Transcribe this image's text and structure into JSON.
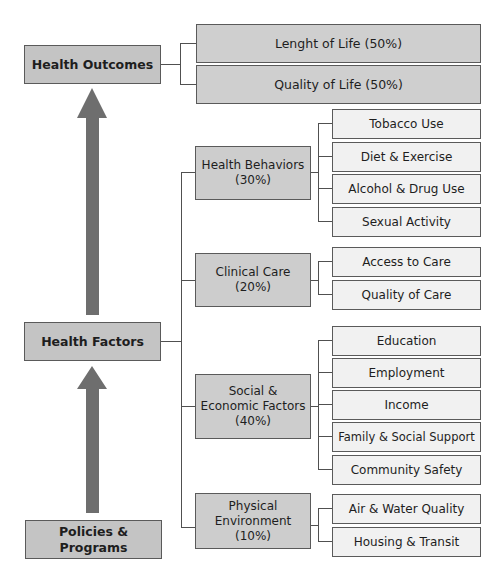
{
  "diagram": {
    "type": "health-factors-model",
    "colors": {
      "main_box": "#c4c4c4",
      "category_box": "#cdcdcd",
      "leaf_box": "#f1f1f1",
      "arrow": "#6e6e6e",
      "line": "#505050"
    },
    "main": {
      "outcomes": "Health Outcomes",
      "factors": "Health Factors",
      "policies": "Policies & Programs"
    },
    "outcomes": [
      {
        "label": "Lenght of Life (50%)"
      },
      {
        "label": "Quality of Life (50%)"
      }
    ],
    "categories": [
      {
        "line1": "Health Behaviors",
        "line2": "(30%)",
        "line3": "",
        "items": [
          "Tobacco Use",
          "Diet & Exercise",
          "Alcohol & Drug Use",
          "Sexual Activity"
        ]
      },
      {
        "line1": "Clinical Care",
        "line2": "(20%)",
        "line3": "",
        "items": [
          "Access to Care",
          "Quality of Care"
        ]
      },
      {
        "line1": "Social &",
        "line2": "Economic Factors",
        "line3": "(40%)",
        "items": [
          "Education",
          "Employment",
          "Income",
          "Family & Social Support",
          "Community Safety"
        ]
      },
      {
        "line1": "Physical",
        "line2": "Environment",
        "line3": "(10%)",
        "items": [
          "Air & Water Quality",
          "Housing & Transit"
        ]
      }
    ]
  }
}
